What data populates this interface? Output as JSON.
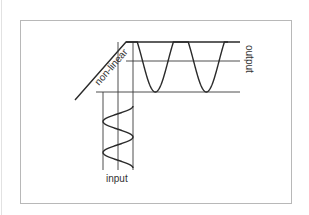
{
  "diagram": {
    "labels": {
      "transfer_curve": "non-linear",
      "output": "output",
      "input": "input"
    },
    "colors": {
      "frame": "#b8b8b8",
      "curve": "#2a2a2a",
      "guides": "#3a3a3a",
      "text": "#333333"
    },
    "input_wave": {
      "cycles": 2,
      "shape": "sine"
    },
    "output_wave": {
      "cycles": 2,
      "shape": "clipped-sine",
      "clipping": "top"
    }
  }
}
